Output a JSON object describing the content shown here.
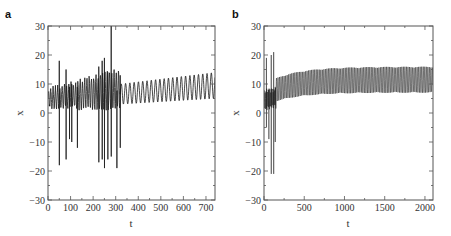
{
  "figure": {
    "panels": [
      {
        "label": "a",
        "xlabel": "t",
        "ylabel": "x"
      },
      {
        "label": "b",
        "xlabel": "t",
        "ylabel": "x"
      }
    ]
  },
  "colors": {
    "line": "#1a1a1a",
    "axis": "#555555",
    "background": "#ffffff"
  },
  "chart_data": [
    {
      "type": "line",
      "panel": "a",
      "title": "",
      "xlabel": "t",
      "ylabel": "x",
      "xlim": [
        0,
        740
      ],
      "ylim": [
        -30,
        30
      ],
      "xticks": [
        0,
        100,
        200,
        300,
        400,
        500,
        600,
        700
      ],
      "yticks": [
        -30,
        -20,
        -10,
        0,
        10,
        20,
        30
      ],
      "grid": false,
      "legend": null,
      "description": "Transient chaotic oscillation with large spikes (t≈0–320), then regular periodic oscillation slowly rising from ~4–10 to ~6–14",
      "spikes": [
        {
          "t": 50,
          "x_min": -18,
          "x_max": 18
        },
        {
          "t": 80,
          "x_min": -16,
          "x_max": 15
        },
        {
          "t": 95,
          "x_min": -9,
          "x_max": 9
        },
        {
          "t": 105,
          "x_min": -10,
          "x_max": 10
        },
        {
          "t": 130,
          "x_min": -12,
          "x_max": 9
        },
        {
          "t": 225,
          "x_min": -17,
          "x_max": 16
        },
        {
          "t": 240,
          "x_min": -16,
          "x_max": 18
        },
        {
          "t": 250,
          "x_min": -19,
          "x_max": 19
        },
        {
          "t": 265,
          "x_min": -16,
          "x_max": 14
        },
        {
          "t": 280,
          "x_min": -15,
          "x_max": 30
        },
        {
          "t": 305,
          "x_min": -19,
          "x_max": 6
        },
        {
          "t": 320,
          "x_min": -12,
          "x_max": 13
        }
      ],
      "periodic_regime": {
        "t_start": 320,
        "t_end": 740,
        "period": 19,
        "min_start": 3,
        "max_start": 10,
        "min_end": 5,
        "max_end": 14
      }
    },
    {
      "type": "line",
      "panel": "b",
      "title": "",
      "xlabel": "t",
      "ylabel": "x",
      "xlim": [
        0,
        2100
      ],
      "ylim": [
        -30,
        30
      ],
      "xticks": [
        0,
        500,
        1000,
        1500,
        2000
      ],
      "yticks": [
        -30,
        -20,
        -10,
        0,
        10,
        20,
        30
      ],
      "grid": false,
      "legend": null,
      "description": "Short chaotic transient (t≈0–150) with spikes to ±20, then dense fast oscillation whose envelope rises from ~5–12 to ~8–16",
      "spikes": [
        {
          "t": 30,
          "x_min": -5,
          "x_max": 19
        },
        {
          "t": 60,
          "x_min": -9,
          "x_max": 8
        },
        {
          "t": 90,
          "x_min": -21,
          "x_max": 20
        },
        {
          "t": 120,
          "x_min": -21,
          "x_max": 21
        },
        {
          "t": 140,
          "x_min": -10,
          "x_max": 9
        }
      ],
      "periodic_regime": {
        "t_start": 150,
        "t_end": 2100,
        "period": 19,
        "min_start": 4,
        "max_start": 12,
        "min_end": 7,
        "max_end": 16
      }
    }
  ]
}
